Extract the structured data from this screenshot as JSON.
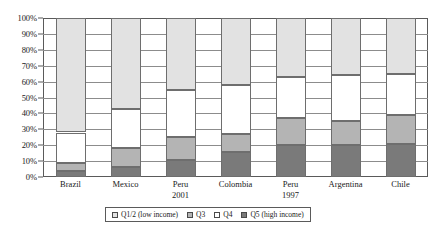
{
  "chart_data": {
    "type": "bar",
    "subtype": "100% stacked column",
    "title": "",
    "subtitle": "",
    "xlabel": "",
    "ylabel": "",
    "ylim": [
      0,
      100
    ],
    "yunit": "%",
    "grid": true,
    "legend_position": "bottom",
    "categories": [
      "Brazil",
      "Mexico",
      "Peru\n2001",
      "Colombia",
      "Peru\n1997",
      "Argentina",
      "Chile"
    ],
    "category_labels": [
      {
        "line1": "Brazil",
        "line2": ""
      },
      {
        "line1": "Mexico",
        "line2": ""
      },
      {
        "line1": "Peru",
        "line2": "2001"
      },
      {
        "line1": "Colombia",
        "line2": ""
      },
      {
        "line1": "Peru",
        "line2": "1997"
      },
      {
        "line1": "Argentina",
        "line2": ""
      },
      {
        "line1": "Chile",
        "line2": ""
      }
    ],
    "ytick_labels": [
      "100%",
      "90%",
      "80%",
      "70%",
      "60%",
      "50%",
      "40%",
      "30%",
      "20%",
      "10%",
      "0%"
    ],
    "ytick_values": [
      100,
      90,
      80,
      70,
      60,
      50,
      40,
      30,
      20,
      10,
      0
    ],
    "stack_order_bottom_to_top": [
      "Q5 (high income)",
      "Q3",
      "Q4",
      "Q1/2 (low income)"
    ],
    "series": [
      {
        "name": "Q5 (high income)",
        "key": "q5",
        "color": "#7a7a7a",
        "values": [
          4,
          6,
          11,
          16,
          20,
          20,
          21
        ]
      },
      {
        "name": "Q3",
        "key": "q3",
        "color": "#b4b4b4",
        "values": [
          5,
          12,
          14,
          11,
          17,
          15,
          18
        ]
      },
      {
        "name": "Q4",
        "key": "q4",
        "color": "#ffffff",
        "values": [
          19,
          25,
          30,
          31,
          26,
          29,
          26
        ]
      },
      {
        "name": "Q1/2 (low income)",
        "key": "q12",
        "color": "#e2e2e2",
        "values": [
          72,
          57,
          45,
          42,
          37,
          36,
          35
        ]
      }
    ],
    "stacked_totals": [
      100,
      100,
      100,
      100,
      100,
      100,
      100
    ]
  },
  "legend": {
    "items": [
      {
        "label": "Q1/2 (low income)",
        "color": "#e2e2e2"
      },
      {
        "label": "Q3",
        "color": "#b4b4b4"
      },
      {
        "label": "Q4",
        "color": "#ffffff"
      },
      {
        "label": "Q5 (high income)",
        "color": "#7a7a7a"
      }
    ]
  },
  "colors": {
    "axis": "#5a5a5a",
    "gridline": "#8c8c8c",
    "segment_border": "#6e6e6e",
    "background": "#ffffff",
    "text": "#1a1a1a"
  }
}
